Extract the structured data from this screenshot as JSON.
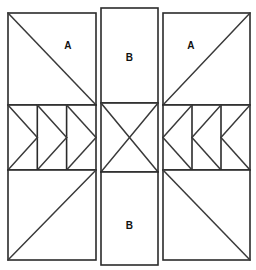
{
  "diagram": {
    "type": "quilt-block-layout",
    "background_color": "#ffffff",
    "line_color": "#2b2b2b",
    "fill_color": "#ffffff",
    "label_color": "#111111",
    "grid": {
      "columns": 3,
      "rows": 3,
      "column_names": [
        "left",
        "center",
        "right"
      ],
      "row_names": [
        "top",
        "middle",
        "bottom"
      ]
    },
    "labels": {
      "top_left": "A",
      "top_center": "B",
      "top_right": "A",
      "bottom_center": "B"
    },
    "patches": [
      {
        "id": "top-left-square",
        "label": "A",
        "shape": "square-with-diagonal",
        "diagonal": "top-left-to-bottom-right"
      },
      {
        "id": "top-center-rect",
        "label": "B",
        "shape": "plain-rectangle",
        "diagonal": "none"
      },
      {
        "id": "top-right-square",
        "label": "A",
        "shape": "square-with-diagonal",
        "diagonal": "bottom-left-to-top-right"
      },
      {
        "id": "middle-left-geese",
        "label": "",
        "shape": "flying-geese-strip",
        "unit_count": 3,
        "point_direction": "right"
      },
      {
        "id": "middle-center-x",
        "label": "",
        "shape": "hourglass-x",
        "diagonal": "both"
      },
      {
        "id": "middle-right-geese",
        "label": "",
        "shape": "flying-geese-strip",
        "unit_count": 3,
        "point_direction": "left"
      },
      {
        "id": "bottom-left-square",
        "label": "",
        "shape": "square-with-diagonal",
        "diagonal": "bottom-left-to-top-right"
      },
      {
        "id": "bottom-center-rect",
        "label": "B",
        "shape": "plain-rectangle",
        "diagonal": "none"
      },
      {
        "id": "bottom-right-square",
        "label": "",
        "shape": "square-with-diagonal",
        "diagonal": "top-left-to-bottom-right"
      }
    ]
  }
}
